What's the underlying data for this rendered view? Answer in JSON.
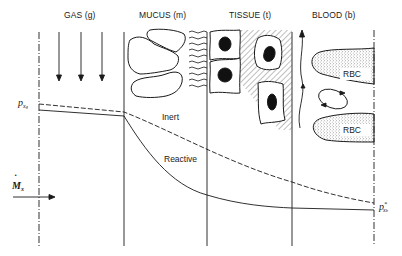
{
  "regions": [
    {
      "key": "gas",
      "label": "GAS (g)"
    },
    {
      "key": "mucus",
      "label": "MUCUS (m)"
    },
    {
      "key": "tissue",
      "label": "TISSUE (t)"
    },
    {
      "key": "blood",
      "label": "BLOOD (b)"
    }
  ],
  "curves": {
    "inert": {
      "label": "Inert",
      "style": "dashed"
    },
    "reactive": {
      "label": "Reactive",
      "style": "solid"
    }
  },
  "symbols": {
    "start_pressure": {
      "base": "p",
      "sub": "x",
      "subsub": "g"
    },
    "end_pressure": {
      "base": "p",
      "sub": "x",
      "subsub": "b",
      "sup": "*"
    },
    "flux": {
      "base": "M",
      "dot": "˙",
      "sub": "x"
    }
  },
  "blood": {
    "rbc_labels": [
      "RBC",
      "RBC"
    ]
  },
  "colors": {
    "line": "#1a1a1a",
    "background": "#ffffff",
    "stipple": "#555555"
  }
}
